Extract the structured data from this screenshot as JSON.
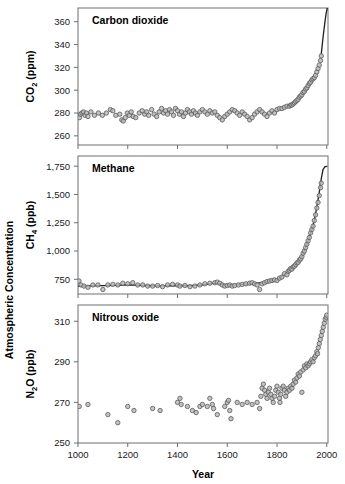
{
  "figure": {
    "xlabel": "Year",
    "ylabel_outer": "Atmospheric Concentration"
  },
  "chart_data": [
    {
      "type": "scatter",
      "title": "Carbon dioxide",
      "xlabel": "Year",
      "ylabel": "CO2 (ppm)",
      "ylabel_text": "CO",
      "ylabel_sub": "2",
      "ylabel_unit": " (ppm)",
      "xlim": [
        1000,
        2005
      ],
      "ylim": [
        252,
        372
      ],
      "xticks": [
        1000,
        1200,
        1400,
        1600,
        1800,
        2000
      ],
      "xticklabels": [
        "1000",
        "1200",
        "1400",
        "1600",
        "1800",
        "2000"
      ],
      "yticks": [
        260,
        280,
        300,
        320,
        340,
        360
      ],
      "yticklabels": [
        "260",
        "280",
        "300",
        "320",
        "340",
        "360"
      ],
      "grid": false,
      "legend": "none",
      "marker": "open-circle-gray",
      "points": [
        [
          1006,
          276
        ],
        [
          1010,
          279
        ],
        [
          1016,
          280
        ],
        [
          1022,
          281
        ],
        [
          1028,
          278
        ],
        [
          1034,
          280
        ],
        [
          1040,
          277
        ],
        [
          1052,
          281
        ],
        [
          1066,
          278
        ],
        [
          1082,
          280
        ],
        [
          1098,
          278
        ],
        [
          1114,
          280
        ],
        [
          1130,
          283
        ],
        [
          1140,
          282
        ],
        [
          1152,
          278
        ],
        [
          1168,
          279
        ],
        [
          1176,
          274
        ],
        [
          1182,
          273
        ],
        [
          1190,
          276
        ],
        [
          1198,
          280
        ],
        [
          1206,
          278
        ],
        [
          1214,
          281
        ],
        [
          1222,
          277
        ],
        [
          1232,
          276
        ],
        [
          1246,
          280
        ],
        [
          1258,
          282
        ],
        [
          1268,
          279
        ],
        [
          1276,
          281
        ],
        [
          1284,
          278
        ],
        [
          1296,
          283
        ],
        [
          1306,
          279
        ],
        [
          1316,
          277
        ],
        [
          1326,
          281
        ],
        [
          1336,
          284
        ],
        [
          1344,
          280
        ],
        [
          1352,
          282
        ],
        [
          1360,
          279
        ],
        [
          1368,
          283
        ],
        [
          1376,
          281
        ],
        [
          1384,
          278
        ],
        [
          1392,
          284
        ],
        [
          1400,
          282
        ],
        [
          1408,
          279
        ],
        [
          1416,
          281
        ],
        [
          1424,
          277
        ],
        [
          1432,
          280
        ],
        [
          1440,
          283
        ],
        [
          1448,
          281
        ],
        [
          1456,
          279
        ],
        [
          1464,
          282
        ],
        [
          1472,
          280
        ],
        [
          1480,
          278
        ],
        [
          1490,
          281
        ],
        [
          1500,
          283
        ],
        [
          1510,
          281
        ],
        [
          1520,
          279
        ],
        [
          1530,
          282
        ],
        [
          1540,
          280
        ],
        [
          1550,
          281
        ],
        [
          1560,
          278
        ],
        [
          1570,
          276
        ],
        [
          1580,
          274
        ],
        [
          1590,
          277
        ],
        [
          1600,
          279
        ],
        [
          1610,
          281
        ],
        [
          1620,
          283
        ],
        [
          1630,
          282
        ],
        [
          1640,
          280
        ],
        [
          1650,
          278
        ],
        [
          1660,
          281
        ],
        [
          1670,
          279
        ],
        [
          1680,
          277
        ],
        [
          1690,
          274
        ],
        [
          1700,
          276
        ],
        [
          1710,
          279
        ],
        [
          1720,
          281
        ],
        [
          1730,
          283
        ],
        [
          1740,
          281
        ],
        [
          1750,
          279
        ],
        [
          1760,
          277
        ],
        [
          1770,
          280
        ],
        [
          1780,
          282
        ],
        [
          1790,
          280
        ],
        [
          1800,
          283
        ],
        [
          1810,
          284
        ],
        [
          1820,
          284
        ],
        [
          1830,
          285
        ],
        [
          1840,
          286
        ],
        [
          1850,
          286
        ],
        [
          1855,
          287
        ],
        [
          1860,
          287
        ],
        [
          1865,
          288
        ],
        [
          1870,
          289
        ],
        [
          1875,
          290
        ],
        [
          1880,
          291
        ],
        [
          1885,
          292
        ],
        [
          1890,
          294
        ],
        [
          1895,
          295
        ],
        [
          1900,
          296
        ],
        [
          1905,
          298
        ],
        [
          1910,
          299
        ],
        [
          1915,
          301
        ],
        [
          1920,
          302
        ],
        [
          1925,
          304
        ],
        [
          1930,
          306
        ],
        [
          1935,
          307
        ],
        [
          1940,
          309
        ],
        [
          1945,
          310
        ],
        [
          1950,
          311
        ],
        [
          1955,
          313
        ],
        [
          1960,
          316
        ],
        [
          1965,
          319
        ],
        [
          1970,
          322
        ],
        [
          1975,
          326
        ],
        [
          1978,
          330
        ]
      ],
      "trend": [
        [
          1978,
          332
        ],
        [
          1982,
          340
        ],
        [
          1986,
          348
        ],
        [
          1990,
          355
        ],
        [
          1994,
          362
        ],
        [
          1998,
          368
        ],
        [
          2002,
          372
        ]
      ]
    },
    {
      "type": "scatter",
      "title": "Methane",
      "xlabel": "Year",
      "ylabel": "CH4 (ppb)",
      "ylabel_text": "CH",
      "ylabel_sub": "4",
      "ylabel_unit": " (ppb)",
      "xlim": [
        1000,
        2005
      ],
      "ylim": [
        620,
        1840
      ],
      "xticks": [
        1000,
        1200,
        1400,
        1600,
        1800,
        2000
      ],
      "xticklabels": [
        "1000",
        "1200",
        "1400",
        "1600",
        "1800",
        "2000"
      ],
      "yticks": [
        750,
        1000,
        1250,
        1500,
        1750
      ],
      "yticklabels": [
        "750",
        "1,000",
        "1,250",
        "1,500",
        "1,750"
      ],
      "grid": false,
      "legend": "none",
      "marker": "open-circle-gray",
      "points": [
        [
          1004,
          735
        ],
        [
          1012,
          700
        ],
        [
          1024,
          690
        ],
        [
          1040,
          680
        ],
        [
          1060,
          700
        ],
        [
          1080,
          700
        ],
        [
          1100,
          660
        ],
        [
          1120,
          700
        ],
        [
          1140,
          705
        ],
        [
          1160,
          700
        ],
        [
          1180,
          715
        ],
        [
          1200,
          710
        ],
        [
          1220,
          720
        ],
        [
          1240,
          700
        ],
        [
          1260,
          700
        ],
        [
          1280,
          690
        ],
        [
          1300,
          690
        ],
        [
          1320,
          695
        ],
        [
          1340,
          685
        ],
        [
          1360,
          700
        ],
        [
          1380,
          705
        ],
        [
          1400,
          700
        ],
        [
          1410,
          690
        ],
        [
          1430,
          695
        ],
        [
          1450,
          685
        ],
        [
          1470,
          690
        ],
        [
          1490,
          700
        ],
        [
          1510,
          710
        ],
        [
          1530,
          715
        ],
        [
          1550,
          720
        ],
        [
          1560,
          725
        ],
        [
          1570,
          715
        ],
        [
          1580,
          700
        ],
        [
          1590,
          690
        ],
        [
          1600,
          695
        ],
        [
          1610,
          700
        ],
        [
          1620,
          690
        ],
        [
          1630,
          695
        ],
        [
          1645,
          700
        ],
        [
          1660,
          705
        ],
        [
          1675,
          710
        ],
        [
          1690,
          715
        ],
        [
          1700,
          720
        ],
        [
          1710,
          710
        ],
        [
          1720,
          700
        ],
        [
          1730,
          660
        ],
        [
          1740,
          710
        ],
        [
          1750,
          720
        ],
        [
          1760,
          730
        ],
        [
          1770,
          735
        ],
        [
          1780,
          740
        ],
        [
          1790,
          745
        ],
        [
          1800,
          740
        ],
        [
          1810,
          760
        ],
        [
          1820,
          770
        ],
        [
          1830,
          800
        ],
        [
          1840,
          790
        ],
        [
          1845,
          820
        ],
        [
          1850,
          830
        ],
        [
          1855,
          845
        ],
        [
          1860,
          840
        ],
        [
          1865,
          860
        ],
        [
          1870,
          865
        ],
        [
          1875,
          880
        ],
        [
          1880,
          895
        ],
        [
          1885,
          900
        ],
        [
          1890,
          920
        ],
        [
          1895,
          930
        ],
        [
          1900,
          950
        ],
        [
          1905,
          980
        ],
        [
          1910,
          1000
        ],
        [
          1915,
          1030
        ],
        [
          1920,
          1060
        ],
        [
          1925,
          1090
        ],
        [
          1930,
          1120
        ],
        [
          1935,
          1160
        ],
        [
          1940,
          1190
        ],
        [
          1945,
          1220
        ],
        [
          1950,
          1270
        ],
        [
          1955,
          1320
        ],
        [
          1960,
          1380
        ],
        [
          1965,
          1430
        ],
        [
          1970,
          1490
        ],
        [
          1975,
          1560
        ],
        [
          1978,
          1600
        ]
      ],
      "trend": [
        [
          1000,
          690
        ],
        [
          1050,
          692
        ],
        [
          1100,
          694
        ],
        [
          1150,
          697
        ],
        [
          1200,
          700
        ],
        [
          1250,
          697
        ],
        [
          1300,
          693
        ],
        [
          1350,
          692
        ],
        [
          1400,
          695
        ],
        [
          1450,
          693
        ],
        [
          1500,
          700
        ],
        [
          1550,
          716
        ],
        [
          1600,
          700
        ],
        [
          1650,
          703
        ],
        [
          1700,
          712
        ],
        [
          1750,
          722
        ],
        [
          1800,
          745
        ],
        [
          1830,
          790
        ],
        [
          1860,
          840
        ],
        [
          1880,
          890
        ],
        [
          1900,
          950
        ],
        [
          1920,
          1060
        ],
        [
          1940,
          1190
        ],
        [
          1950,
          1270
        ],
        [
          1960,
          1390
        ],
        [
          1970,
          1520
        ],
        [
          1978,
          1640
        ],
        [
          1985,
          1720
        ],
        [
          1992,
          1745
        ],
        [
          2000,
          1748
        ]
      ]
    },
    {
      "type": "scatter",
      "title": "Nitrous oxide",
      "xlabel": "Year",
      "ylabel": "N2O (ppb)",
      "ylabel_text": "N",
      "ylabel_sub": "2",
      "ylabel_unit": "O  (ppb)",
      "xlim": [
        1000,
        2005
      ],
      "ylim": [
        250,
        318
      ],
      "xticks": [
        1000,
        1200,
        1400,
        1600,
        1800,
        2000
      ],
      "xticklabels": [
        "1000",
        "1200",
        "1400",
        "1600",
        "1800",
        "2000"
      ],
      "yticks": [
        250,
        270,
        290,
        310
      ],
      "yticklabels": [
        "250",
        "270",
        "290",
        "310"
      ],
      "grid": false,
      "legend": "none",
      "marker": "open-circle-gray",
      "points": [
        [
          1005,
          268
        ],
        [
          1040,
          269
        ],
        [
          1120,
          264
        ],
        [
          1160,
          260
        ],
        [
          1200,
          268
        ],
        [
          1225,
          266
        ],
        [
          1300,
          267
        ],
        [
          1330,
          266
        ],
        [
          1400,
          270
        ],
        [
          1410,
          272
        ],
        [
          1415,
          269
        ],
        [
          1440,
          268
        ],
        [
          1460,
          266
        ],
        [
          1475,
          265
        ],
        [
          1490,
          268
        ],
        [
          1500,
          269
        ],
        [
          1520,
          268
        ],
        [
          1530,
          272
        ],
        [
          1540,
          269
        ],
        [
          1545,
          267
        ],
        [
          1560,
          264
        ],
        [
          1590,
          268
        ],
        [
          1600,
          270
        ],
        [
          1605,
          271
        ],
        [
          1610,
          266
        ],
        [
          1615,
          262
        ],
        [
          1640,
          270
        ],
        [
          1660,
          269
        ],
        [
          1680,
          270
        ],
        [
          1700,
          269
        ],
        [
          1720,
          270
        ],
        [
          1730,
          267
        ],
        [
          1735,
          273
        ],
        [
          1740,
          277
        ],
        [
          1745,
          279
        ],
        [
          1750,
          276
        ],
        [
          1755,
          274
        ],
        [
          1760,
          272
        ],
        [
          1765,
          275
        ],
        [
          1770,
          277
        ],
        [
          1775,
          274
        ],
        [
          1780,
          272
        ],
        [
          1785,
          270
        ],
        [
          1790,
          273
        ],
        [
          1795,
          276
        ],
        [
          1800,
          278
        ],
        [
          1805,
          275
        ],
        [
          1810,
          272
        ],
        [
          1812,
          270
        ],
        [
          1815,
          274
        ],
        [
          1820,
          277
        ],
        [
          1825,
          278
        ],
        [
          1830,
          276
        ],
        [
          1835,
          273
        ],
        [
          1840,
          275
        ],
        [
          1845,
          277
        ],
        [
          1850,
          276
        ],
        [
          1855,
          278
        ],
        [
          1860,
          277
        ],
        [
          1865,
          279
        ],
        [
          1870,
          281
        ],
        [
          1875,
          280
        ],
        [
          1880,
          282
        ],
        [
          1885,
          284
        ],
        [
          1890,
          283
        ],
        [
          1895,
          285
        ],
        [
          1900,
          275
        ],
        [
          1905,
          286
        ],
        [
          1910,
          288
        ],
        [
          1915,
          287
        ],
        [
          1920,
          289
        ],
        [
          1925,
          288
        ],
        [
          1930,
          289
        ],
        [
          1935,
          290
        ],
        [
          1940,
          291
        ],
        [
          1945,
          290
        ],
        [
          1950,
          292
        ],
        [
          1955,
          293
        ],
        [
          1960,
          295
        ],
        [
          1963,
          294
        ],
        [
          1966,
          297
        ],
        [
          1970,
          299
        ],
        [
          1974,
          301
        ],
        [
          1978,
          303
        ],
        [
          1982,
          305
        ],
        [
          1986,
          307
        ],
        [
          1990,
          309
        ],
        [
          1994,
          311
        ],
        [
          1998,
          312
        ],
        [
          2000,
          313
        ]
      ],
      "trend": []
    }
  ]
}
